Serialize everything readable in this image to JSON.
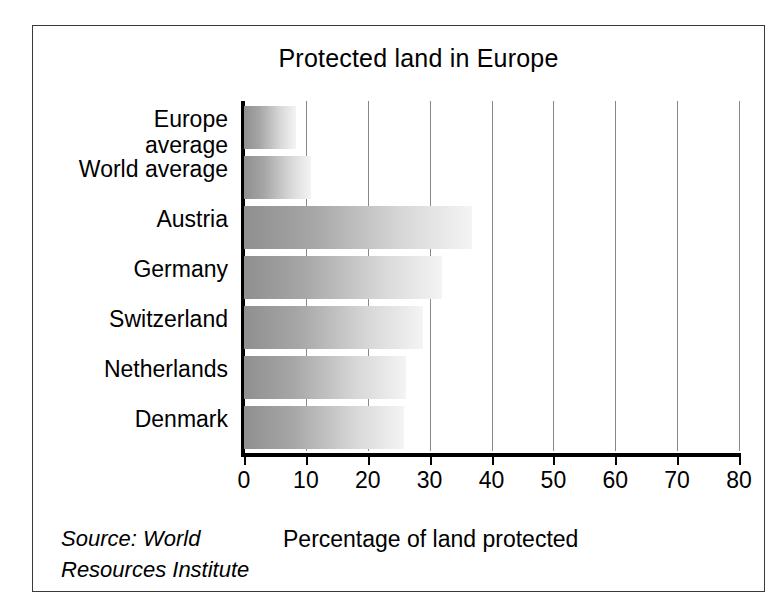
{
  "chart_data": {
    "type": "bar",
    "orientation": "horizontal",
    "title": "Protected land in Europe",
    "xlabel": "Percentage of land protected",
    "ylabel": "",
    "categories": [
      "Europe\naverage",
      "World average",
      "Austria",
      "Germany",
      "Switzerland",
      "Netherlands",
      "Denmark"
    ],
    "values": [
      8.4,
      10.8,
      36.8,
      32.0,
      29.0,
      26.2,
      25.8
    ],
    "xlim": [
      0,
      80
    ],
    "xticks": [
      0,
      10,
      20,
      30,
      40,
      50,
      60,
      70,
      80
    ],
    "xtick_labels": [
      "0",
      "10",
      "20",
      "30",
      "40",
      "50",
      "60",
      "70",
      "80"
    ],
    "grid": "vertical",
    "legend": "none",
    "source_note": "Source: World\nResources Institute",
    "bar_fill": "gradient-gray",
    "colors": {
      "bar_start": "#8f8f8f",
      "bar_end": "#f4f4f4",
      "axis": "#000000",
      "gridline": "#888888",
      "frame": "#3a3a3a",
      "text": "#000000",
      "background": "#ffffff"
    }
  }
}
